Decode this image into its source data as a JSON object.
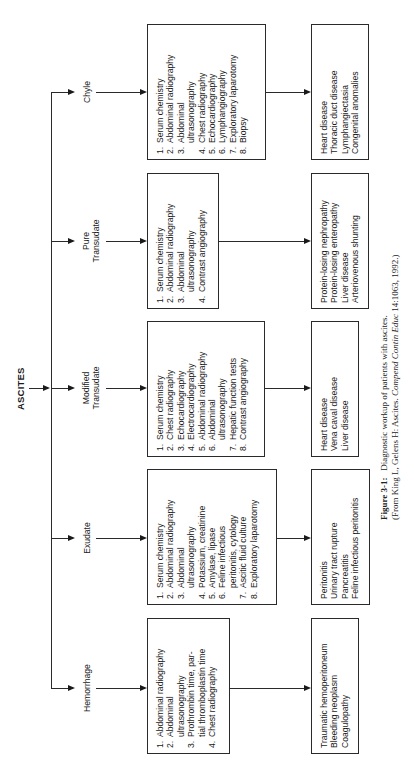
{
  "title": "ASCITES",
  "branches": [
    {
      "id": "chyle",
      "label_lines": [
        "Chyle"
      ],
      "tests": [
        {
          "num": "1.",
          "text": "Serum chemistry"
        },
        {
          "num": "2.",
          "text": "Abdominal radiography"
        },
        {
          "num": "3.",
          "text": "Abdominal",
          "cont": "ultrasonography"
        },
        {
          "num": "4.",
          "text": "Chest radiography"
        },
        {
          "num": "5.",
          "text": "Echocardiography"
        },
        {
          "num": "6.",
          "text": "Lymphangiography"
        },
        {
          "num": "7.",
          "text": "Exploratory laparotomy"
        },
        {
          "num": "8.",
          "text": "Biopsy"
        }
      ],
      "results": [
        "Heart disease",
        "Thoracic duct disease",
        "Lymphangiectasia",
        "Congenital anomalies"
      ]
    },
    {
      "id": "pure-transudate",
      "label_lines": [
        "Pure",
        "Transudate"
      ],
      "tests": [
        {
          "num": "1.",
          "text": "Serum chemistry"
        },
        {
          "num": "2.",
          "text": "Abdominal radiography"
        },
        {
          "num": "3.",
          "text": "Abdominal",
          "cont": "ultrasonography"
        },
        {
          "num": "4.",
          "text": "Contrast angiography"
        }
      ],
      "results": [
        "Protein-losing nephropathy",
        "Protein-losing enteropathy",
        "Liver disease",
        "Arteriovenous shunting"
      ]
    },
    {
      "id": "modified-transudate",
      "label_lines": [
        "Modified",
        "Transudate"
      ],
      "tests": [
        {
          "num": "1.",
          "text": "Serum chemistry"
        },
        {
          "num": "2.",
          "text": "Chest radiography"
        },
        {
          "num": "3.",
          "text": "Echocardiography"
        },
        {
          "num": "4.",
          "text": "Electrocardiography"
        },
        {
          "num": "5.",
          "text": "Abdominal radiography"
        },
        {
          "num": "6.",
          "text": "Abdominal",
          "cont": "ultrasonography"
        },
        {
          "num": "7.",
          "text": "Hepatic function tests"
        },
        {
          "num": "8.",
          "text": "Contrast angiography"
        }
      ],
      "results": [
        "Heart disease",
        "Vena caval disease",
        "Liver disease"
      ]
    },
    {
      "id": "exudate",
      "label_lines": [
        "Exudate"
      ],
      "tests": [
        {
          "num": "1.",
          "text": "Serum chemistry"
        },
        {
          "num": "2.",
          "text": "Abdominal radiography"
        },
        {
          "num": "3.",
          "text": "Abdominal",
          "cont": "ultrasonography"
        },
        {
          "num": "4.",
          "text": "Potassium, creatinine"
        },
        {
          "num": "5.",
          "text": "Amylase, lipase"
        },
        {
          "num": "6.",
          "text": "Feline infectious",
          "cont": "peritonitis, cytology"
        },
        {
          "num": "7.",
          "text": "Ascitic fluid culture"
        },
        {
          "num": "8.",
          "text": "Exploratory laparotomy"
        }
      ],
      "results": [
        "Peritonitis",
        "Urinary tract rupture",
        "Pancreatitis",
        "Feline infectious peritonitis"
      ]
    },
    {
      "id": "hemorrhage",
      "label_lines": [
        "Hemorrhage"
      ],
      "tests": [
        {
          "num": "1.",
          "text": "Abdominal radiography"
        },
        {
          "num": "2.",
          "text": "Abdominal",
          "cont": "ultrasonography"
        },
        {
          "num": "3.",
          "text": "Prothrombin time, par-",
          "cont": "tial thromboplastin time"
        },
        {
          "num": "4.",
          "text": "Chest radiography"
        }
      ],
      "results": [
        "Traumatic hemoperitoneum",
        "Bleeding neoplasm",
        "Coagulopathy"
      ]
    }
  ],
  "caption": {
    "figure_label": "Figure 3-1:",
    "figure_text": "Diagnostic workup of patients with ascites.",
    "source_prefix": "(From King L, Gelens H: Ascites. ",
    "source_journal": "Compend Contin Educ",
    "source_suffix": " 14:1063, 1992.)"
  }
}
